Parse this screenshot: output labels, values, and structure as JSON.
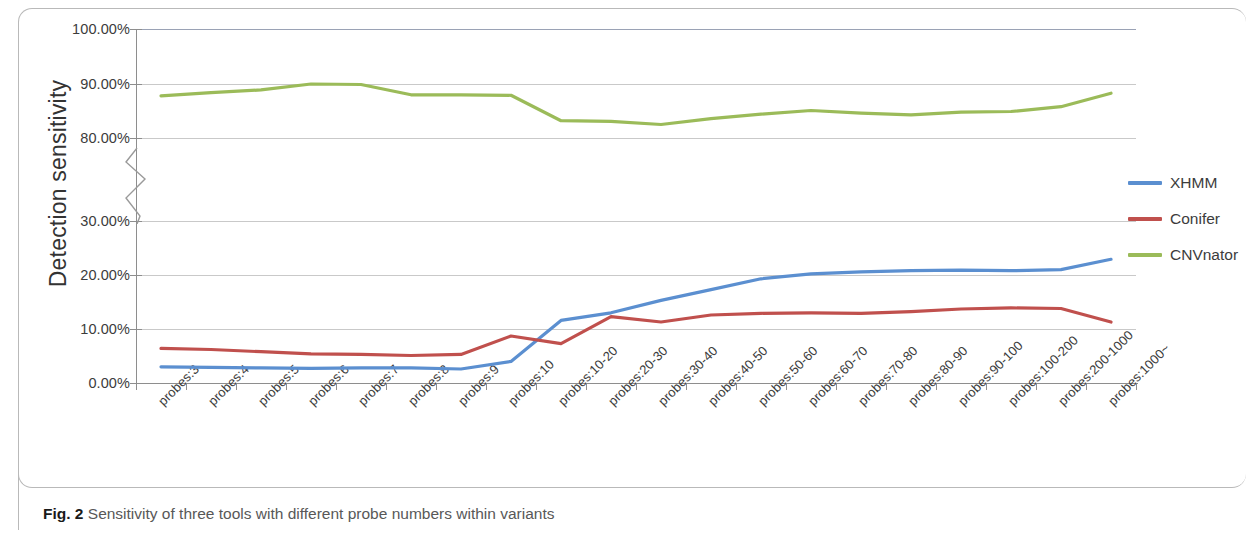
{
  "figure": {
    "caption_label": "Fig. 2",
    "caption_text": " Sensitivity of three tools with different probe numbers within variants"
  },
  "legend": {
    "position": "right",
    "items": [
      {
        "label": "XHMM",
        "color": "#5b8fd0"
      },
      {
        "label": "Conifer",
        "color": "#c0504d"
      },
      {
        "label": "CNVnator",
        "color": "#9bbb59"
      }
    ]
  },
  "axis": {
    "ylabel": "Detection sensitivity",
    "yticks": [
      "0.00%",
      "10.00%",
      "20.00%",
      "30.00%",
      "80.00%",
      "90.00%",
      "100.00%"
    ],
    "broken_between": [
      "30.00%",
      "80.00%"
    ]
  },
  "chart_data": {
    "type": "line",
    "title": "Sensitivity of three tools with different probe numbers within variants",
    "xlabel": "",
    "ylabel": "Detection sensitivity",
    "ylim": [
      0,
      100
    ],
    "y_axis_break": [
      30,
      80
    ],
    "ytick_values": [
      0,
      10,
      20,
      30,
      80,
      90,
      100
    ],
    "ytick_labels": [
      "0.00%",
      "10.00%",
      "20.00%",
      "30.00%",
      "80.00%",
      "90.00%",
      "100.00%"
    ],
    "grid": true,
    "legend_position": "right",
    "categories": [
      "probes:3",
      "probes:4",
      "probes:5",
      "probes:6",
      "probes:7",
      "probes:8",
      "probes:9",
      "probes:10",
      "probes:10-20",
      "probes:20-30",
      "probes:30-40",
      "probes:40-50",
      "probes:50-60",
      "probes:60-70",
      "probes:70-80",
      "probes:80-90",
      "probes:90-100",
      "probes:100-200",
      "probes:200-1000",
      "probes:1000~"
    ],
    "series": [
      {
        "name": "XHMM",
        "color": "#5b8fd0",
        "values": [
          3.0,
          2.9,
          2.8,
          2.7,
          2.8,
          2.8,
          2.6,
          4.0,
          11.6,
          13.0,
          15.3,
          17.3,
          19.3,
          20.2,
          20.6,
          20.8,
          20.9,
          20.8,
          21.0,
          22.9
        ]
      },
      {
        "name": "Conifer",
        "color": "#c0504d",
        "values": [
          6.4,
          6.2,
          5.8,
          5.4,
          5.3,
          5.1,
          5.3,
          8.7,
          7.3,
          12.3,
          11.3,
          12.6,
          12.9,
          13.0,
          12.9,
          13.2,
          13.7,
          13.9,
          13.8,
          11.3
        ]
      },
      {
        "name": "CNVnator",
        "color": "#9bbb59",
        "values": [
          87.8,
          88.4,
          88.9,
          90.0,
          89.9,
          88.0,
          88.0,
          87.9,
          83.2,
          83.1,
          82.5,
          83.6,
          84.4,
          85.1,
          84.6,
          84.3,
          84.8,
          84.9,
          85.8,
          88.3
        ]
      }
    ]
  }
}
